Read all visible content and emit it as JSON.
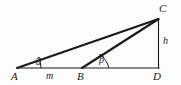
{
  "figure": {
    "kind": "geometry-diagram",
    "background_color": "#fcfcfc",
    "stroke_color": "#1a1a1a"
  },
  "vertices": [
    {
      "id": "A",
      "label": "A",
      "x": 17,
      "y": 68,
      "label_x": 13,
      "label_y": 72
    },
    {
      "id": "B",
      "label": "B",
      "x": 82,
      "y": 68,
      "label_x": 78,
      "label_y": 72
    },
    {
      "id": "D",
      "label": "D",
      "x": 158,
      "y": 68,
      "label_x": 155,
      "label_y": 72
    },
    {
      "id": "C",
      "label": "C",
      "x": 158,
      "y": 19,
      "label_x": 160,
      "label_y": 4
    }
  ],
  "segments": [
    {
      "id": "AC",
      "from": "A",
      "to": "C",
      "width": 2.1,
      "note": "hypotenuse from A to C"
    },
    {
      "id": "AD",
      "from": "A",
      "to": "D",
      "width": 1.0,
      "note": "baseline through B to D"
    },
    {
      "id": "BC",
      "from": "B",
      "to": "C",
      "width": 2.1,
      "note": "segment from B to C"
    },
    {
      "id": "CD",
      "from": "C",
      "to": "D",
      "width": 1.1,
      "note": "vertical height"
    }
  ],
  "segment_labels": [
    {
      "id": "m",
      "label": "m",
      "x": 48,
      "y": 71,
      "note": "length of AB"
    },
    {
      "id": "h",
      "label": "h",
      "x": 164,
      "y": 37,
      "note": "height CD"
    }
  ],
  "angles": [
    {
      "id": "alpha",
      "label": "α",
      "at_vertex": "A",
      "x": 38,
      "y": 56,
      "arc_radius": 22
    },
    {
      "id": "beta",
      "label": "β",
      "at_vertex": "B",
      "x": 101,
      "y": 55,
      "arc_radius": 25
    }
  ]
}
